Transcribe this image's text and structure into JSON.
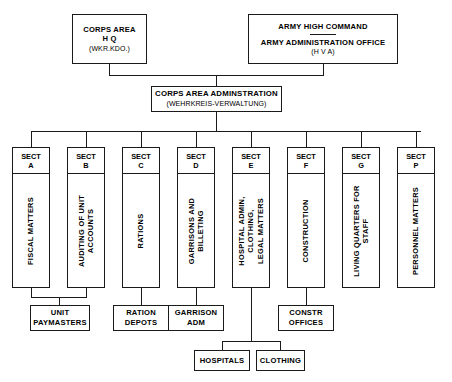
{
  "chart": {
    "type": "org-chart",
    "nodes": {
      "corps_area_hq": {
        "line1": "CORPS AREA",
        "line2": "H Q",
        "abbrev": "(WKR.KDO.)"
      },
      "army_high_command": {
        "line1": "ARMY HIGH COMMAND",
        "line2": "ARMY ADMINISTRATION OFFICE",
        "abbrev": "(H V A)"
      },
      "corps_area_administration": {
        "line1": "CORPS AREA ADMINSTRATION",
        "abbrev": "(WEHRKREIS-VERWALTUNG)"
      }
    },
    "sections": [
      {
        "id": "A",
        "head1": "SECT",
        "head2": "A",
        "label": "FISCAL MATTERS"
      },
      {
        "id": "B",
        "head1": "SECT",
        "head2": "B",
        "label": "AUDITING OF UNIT\nACCOUNTS"
      },
      {
        "id": "C",
        "head1": "SECT",
        "head2": "C",
        "label": "RATIONS"
      },
      {
        "id": "D",
        "head1": "SECT",
        "head2": "D",
        "label": "GARRISONS AND\nBILLETING"
      },
      {
        "id": "E",
        "head1": "SECT",
        "head2": "E",
        "label": "HOSPITAL ADMIN,\nCLOTHING,\nLEGAL MATTERS"
      },
      {
        "id": "F",
        "head1": "SECT",
        "head2": "F",
        "label": "CONSTRUCTION"
      },
      {
        "id": "G",
        "head1": "SECT",
        "head2": "G",
        "label": "LIVING QUARTERS FOR\nSTAFF"
      },
      {
        "id": "P",
        "head1": "SECT",
        "head2": "P",
        "label": "PERSONNEL MATTERS"
      }
    ],
    "subordinates": [
      {
        "id": "unit_paymasters",
        "line1": "UNIT",
        "line2": "PAYMASTERS",
        "parents": [
          "A",
          "B"
        ]
      },
      {
        "id": "ration_depots",
        "line1": "RATION",
        "line2": "DEPOTS",
        "parents": [
          "C"
        ]
      },
      {
        "id": "garrison_adm",
        "line1": "GARRISON",
        "line2": "ADM",
        "parents": [
          "D"
        ]
      },
      {
        "id": "constr_offices",
        "line1": "CONSTR",
        "line2": "OFFICES",
        "parents": [
          "F"
        ]
      },
      {
        "id": "hospitals",
        "line1": "HOSPITALS",
        "line2": "",
        "parents": [
          "E"
        ]
      },
      {
        "id": "clothing",
        "line1": "CLOTHING",
        "line2": "",
        "parents": [
          "E"
        ]
      }
    ],
    "colors": {
      "background": "#ffffff",
      "stroke": "#1a1a1a",
      "text": "#000000"
    }
  }
}
